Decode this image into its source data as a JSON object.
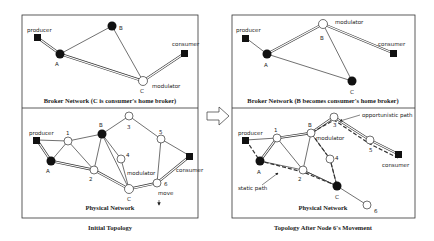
{
  "left_panel": {
    "broker_caption": "Broker Network (C is consumer's home broker)",
    "physical_caption": "Physical Network",
    "title": "Initial Topology",
    "broker_labels": {
      "producer": "producer",
      "consumer": "consumer",
      "A": "A",
      "B": "B",
      "C": "C",
      "modulator": "modulator"
    },
    "physical_labels": {
      "producer": "producer",
      "consumer": "consumer",
      "A": "A",
      "B": "B",
      "C": "C",
      "n1": "1",
      "n2": "2",
      "n3": "3",
      "n4": "4",
      "n5": "5",
      "n6": "6",
      "modulator": "modulator",
      "move": "move"
    }
  },
  "right_panel": {
    "broker_caption": "Broker Network (B becomes consumer's home broker)",
    "physical_caption": "Physical Network",
    "title": "Topology After Node 6's Movement",
    "broker_labels": {
      "producer": "producer",
      "consumer": "consumer",
      "A": "A",
      "B": "B",
      "C": "C",
      "modulator": "modulator"
    },
    "physical_labels": {
      "producer": "producer",
      "consumer": "consumer",
      "A": "A",
      "B": "B",
      "C": "C",
      "n1": "1",
      "n2": "2",
      "n3": "3",
      "n4": "4",
      "n5": "5",
      "n6": "6",
      "modulator": "modulator",
      "opportunistic": "opportunistic path",
      "static": "static path"
    }
  },
  "arrow": "transition-arrow"
}
